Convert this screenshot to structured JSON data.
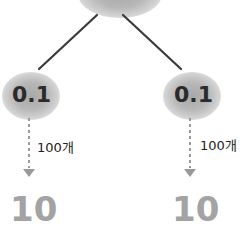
{
  "diagram": {
    "colors": {
      "blob": "#b3b3b3",
      "edge": "#3a3a3a",
      "node_text": "#2b2b2b",
      "arrow": "#9a9a9a",
      "result_text": "#a3a3a3",
      "count_text": "#222222"
    },
    "root": {
      "label": ""
    },
    "branches": [
      {
        "node_label": "0.1",
        "count_label": "100개",
        "result_label": "10"
      },
      {
        "node_label": "0.1",
        "count_label": "100개",
        "result_label": "10"
      }
    ]
  }
}
